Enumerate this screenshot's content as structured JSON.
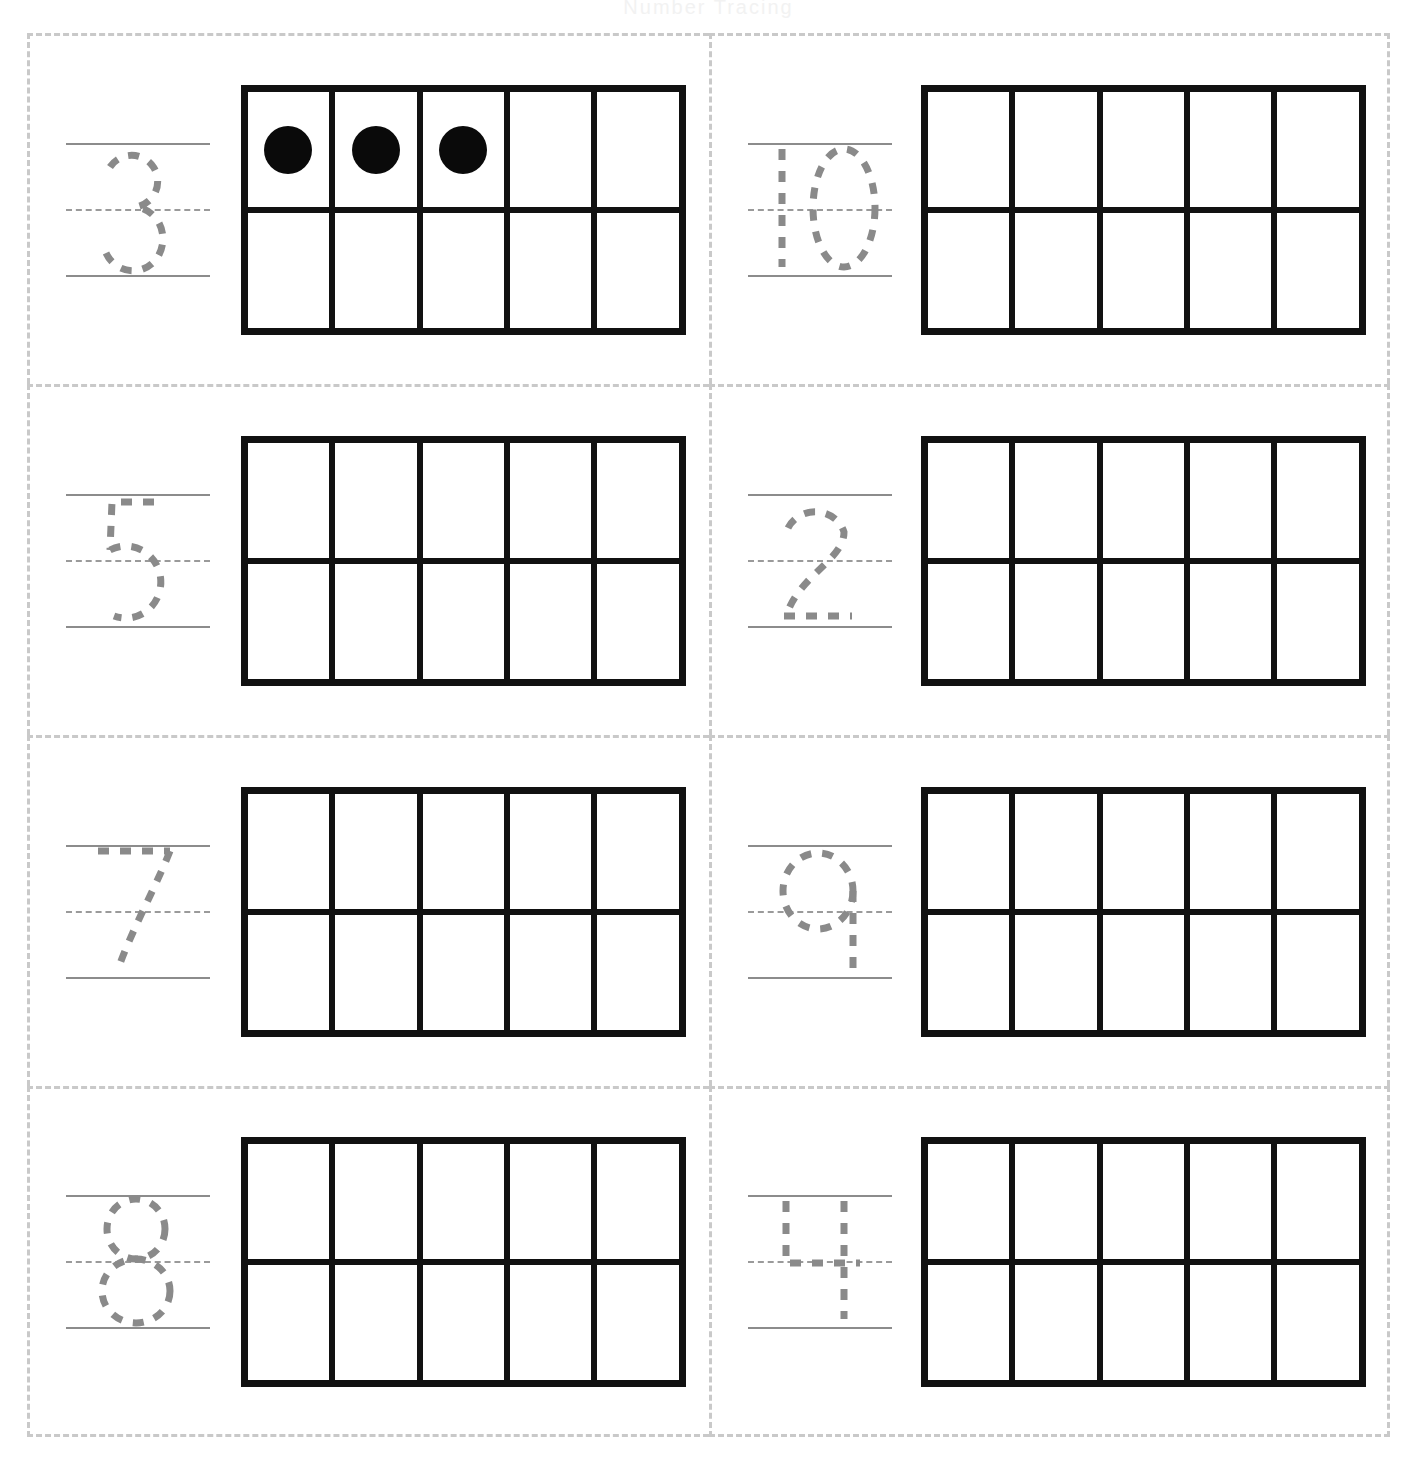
{
  "worksheet": {
    "title_remnant": "Number Tracing",
    "colors": {
      "cell_border": "#c9c9c9",
      "frame_border": "#111111",
      "dot_fill": "#0a0a0a",
      "trace_stroke": "#8a8a8a",
      "guide_line": "#8c8c8c",
      "page_background": "#ffffff"
    },
    "layout": {
      "rows": 4,
      "columns": 2,
      "ten_frame_columns": 5,
      "ten_frame_rows": 2
    },
    "problems": [
      {
        "id": "problem-1",
        "number_label": "3",
        "glyph": "three",
        "dots_filled": 3,
        "ten_frame_total": 10
      },
      {
        "id": "problem-2",
        "number_label": "10",
        "glyph": "ten",
        "dots_filled": 0,
        "ten_frame_total": 10
      },
      {
        "id": "problem-3",
        "number_label": "5",
        "glyph": "five",
        "dots_filled": 0,
        "ten_frame_total": 10
      },
      {
        "id": "problem-4",
        "number_label": "2",
        "glyph": "two",
        "dots_filled": 0,
        "ten_frame_total": 10
      },
      {
        "id": "problem-5",
        "number_label": "7",
        "glyph": "seven",
        "dots_filled": 0,
        "ten_frame_total": 10
      },
      {
        "id": "problem-6",
        "number_label": "9",
        "glyph": "nine",
        "dots_filled": 0,
        "ten_frame_total": 10
      },
      {
        "id": "problem-7",
        "number_label": "8",
        "glyph": "eight",
        "dots_filled": 0,
        "ten_frame_total": 10
      },
      {
        "id": "problem-8",
        "number_label": "4",
        "glyph": "four",
        "dots_filled": 0,
        "ten_frame_total": 10
      }
    ]
  }
}
